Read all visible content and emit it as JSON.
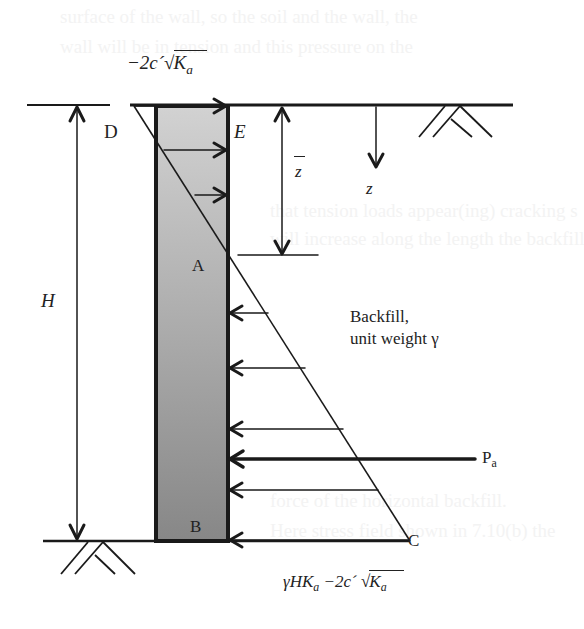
{
  "figure": {
    "labels": {
      "top_tension": {
        "prefix": "−2c´",
        "radical": "√",
        "K": "K",
        "sub": "a"
      },
      "point_d": "D",
      "point_e": "E",
      "point_a": "A",
      "point_b": "B",
      "point_c": "C",
      "height": "H",
      "zbar": "z",
      "depth": "z",
      "backfill_line1": "Backfill,",
      "backfill_line2": "unit weight γ",
      "resultant": {
        "P": "P",
        "sub": "a"
      },
      "bottom_pressure": {
        "prefix": "γHK",
        "sub1": "a",
        "mid": " −2c´ ",
        "radical": "√",
        "K": "K",
        "sub2": "a"
      }
    },
    "colors": {
      "line": "#1a1a1a",
      "wall_top": "#cfcfcf",
      "wall_bottom": "#8a8a8a",
      "background": "#ffffff"
    },
    "faded_background_text": [
      "surface of the wall, so the soil and the wall, the",
      "wall will be in tension and this pressure on the",
      "σ = σₒKₐ − 2c´√Kₐ",
      "that tension loads appear(ing) cracking s",
      "will increase along the length the backfill",
      "based on the Rankine's theory",
      "σ′ₐ = γzKₐ − 2c´√Kₐ",
      "force of the horizontal backfill.",
      "Here stress field shown in 7.10(b) the",
      "(total) is given by (lateral force)"
    ]
  }
}
